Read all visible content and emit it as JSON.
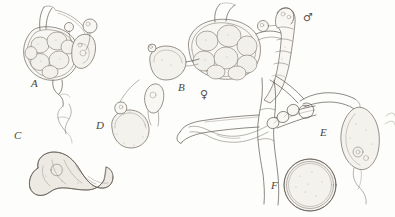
{
  "plate": {
    "title": "Life-cycle plate",
    "medium": "ink line drawing",
    "background_color": "#fdfdfb",
    "ink_color": "#5d564f",
    "width": 395,
    "height": 217
  },
  "labels": [
    {
      "id": "A",
      "text": "A",
      "x": 31,
      "y": 84,
      "caption": "zoosporangium with spores"
    },
    {
      "id": "B",
      "text": "B",
      "x": 178,
      "y": 88,
      "caption": "oogonium with oospores"
    },
    {
      "id": "C",
      "text": "C",
      "x": 14,
      "y": 136,
      "caption": "curved resting body"
    },
    {
      "id": "D",
      "text": "D",
      "x": 96,
      "y": 126,
      "caption": "encysted zoospore with papilla"
    },
    {
      "id": "E",
      "text": "E",
      "x": 320,
      "y": 133,
      "caption": "biflagellate zoospore"
    },
    {
      "id": "F",
      "text": "F",
      "x": 271,
      "y": 186,
      "caption": "thick-walled resting spore"
    }
  ],
  "sex_symbols": [
    {
      "id": "female",
      "glyph": "♀",
      "name": "female-symbol",
      "x": 200,
      "y": 94,
      "refers_to": "B"
    },
    {
      "id": "male",
      "glyph": "♂",
      "name": "male-symbol",
      "x": 303,
      "y": 16,
      "refers_to": "antheridium"
    }
  ],
  "structures": [
    {
      "id": "A",
      "name": "zoosporangium",
      "spore_count": 7
    },
    {
      "id": "B",
      "name": "oogonium",
      "spore_count": 8
    },
    {
      "id": "antheridium",
      "name": "antheridium-on-hypha"
    },
    {
      "id": "C",
      "name": "curved-resting-body"
    },
    {
      "id": "D",
      "name": "encysted-zoospore"
    },
    {
      "id": "E",
      "name": "motile-zoospore"
    },
    {
      "id": "F",
      "name": "resting-spore"
    },
    {
      "id": "hypha",
      "name": "branching-hypha"
    }
  ]
}
